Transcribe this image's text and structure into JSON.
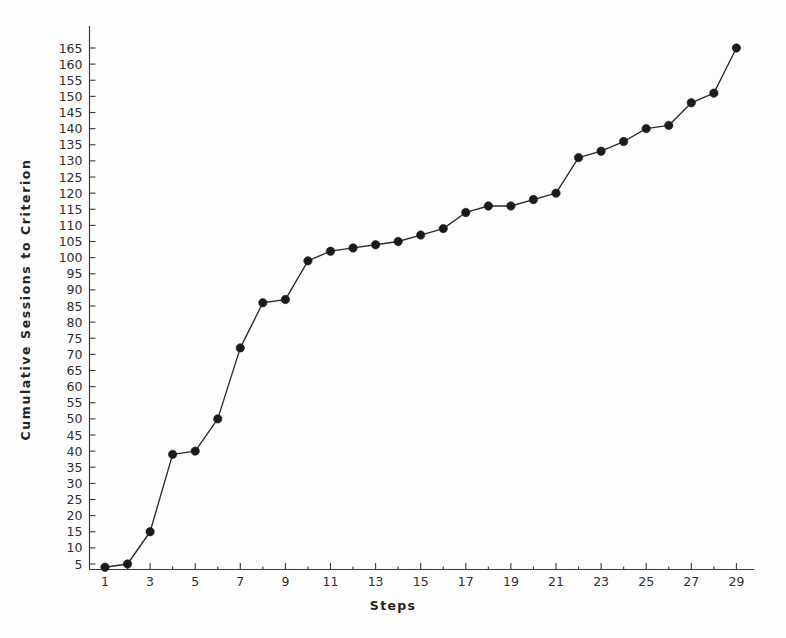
{
  "chart_data": {
    "type": "line",
    "title": "",
    "xlabel": "Steps",
    "ylabel": "Cumulative Sessions to Criterion",
    "x": [
      1,
      2,
      3,
      4,
      5,
      6,
      7,
      8,
      9,
      10,
      11,
      12,
      13,
      14,
      15,
      16,
      17,
      18,
      19,
      20,
      21,
      22,
      23,
      24,
      25,
      26,
      27,
      28,
      29
    ],
    "values": [
      4,
      5,
      15,
      39,
      40,
      50,
      72,
      86,
      87,
      99,
      102,
      103,
      104,
      105,
      107,
      109,
      114,
      116,
      116,
      118,
      120,
      131,
      133,
      136,
      140,
      141,
      148,
      151,
      165
    ],
    "series": [
      {
        "name": "Cumulative Sessions to Criterion",
        "values": [
          4,
          5,
          15,
          39,
          40,
          50,
          72,
          86,
          87,
          99,
          102,
          103,
          104,
          105,
          107,
          109,
          114,
          116,
          116,
          118,
          120,
          131,
          133,
          136,
          140,
          141,
          148,
          151,
          165
        ]
      }
    ],
    "xlim": [
      0,
      30
    ],
    "ylim": [
      0,
      170
    ],
    "xtick_values": [
      1,
      3,
      5,
      7,
      9,
      11,
      13,
      15,
      17,
      19,
      21,
      23,
      25,
      27,
      29
    ],
    "xtick_labels": [
      "1",
      "3",
      "5",
      "7",
      "9",
      "11",
      "13",
      "15",
      "17",
      "19",
      "21",
      "23",
      "25",
      "27",
      "29"
    ],
    "xtick_minor_values": [
      2,
      4,
      6,
      8,
      10,
      12,
      14,
      16,
      18,
      20,
      22,
      24,
      26,
      28
    ],
    "ytick_values": [
      5,
      10,
      15,
      20,
      25,
      30,
      35,
      40,
      45,
      50,
      55,
      60,
      65,
      70,
      75,
      80,
      85,
      90,
      95,
      100,
      105,
      110,
      115,
      120,
      125,
      130,
      135,
      140,
      145,
      150,
      155,
      160,
      165
    ],
    "ytick_labels": [
      "5",
      "10",
      "15",
      "20",
      "25",
      "30",
      "35",
      "40",
      "45",
      "50",
      "55",
      "60",
      "65",
      "70",
      "75",
      "80",
      "85",
      "90",
      "95",
      "100",
      "105",
      "110",
      "115",
      "120",
      "125",
      "130",
      "135",
      "140",
      "145",
      "150",
      "155",
      "160",
      "165"
    ],
    "grid": false,
    "legend": false,
    "marker": "filled-circle",
    "line_color": "#2a2a2a",
    "marker_color": "#1b1b1b",
    "background_color": "#fdfdfd"
  },
  "figure": {
    "axis_color": "#3a3a3a",
    "text_color": "#2f2f2f"
  }
}
